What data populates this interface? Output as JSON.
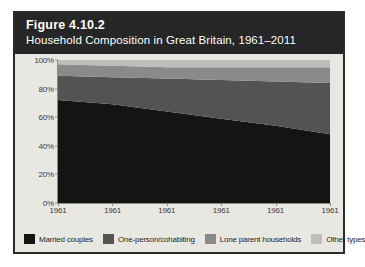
{
  "figure": {
    "number": "Figure 4.10.2",
    "title": "Household Composition in Great Britain, 1961–2011"
  },
  "colors": {
    "header_background": "#262626",
    "card_background": "#e9e7e2",
    "plot_background": "#f3f1ed",
    "border": "#2b2b2b",
    "axis": "#8d8a85",
    "married_couples": "#141414",
    "one_person_cohabiting": "#535353",
    "lone_parent_households": "#8a8a8a",
    "other_types": "#bdbdbd"
  },
  "legend": {
    "items": [
      {
        "label": "Married couples",
        "color": "#141414"
      },
      {
        "label": "One-person/cohabiting",
        "color": "#535353"
      },
      {
        "label": "Lone parent households",
        "color": "#8a8a8a"
      },
      {
        "label": "Other types",
        "color": "#bdbdbd"
      }
    ]
  },
  "chart_data": {
    "type": "area",
    "stacked": true,
    "normalized": true,
    "title": "Household Composition in Great Britain, 1961–2011",
    "xlabel": "",
    "ylabel": "",
    "ylim": [
      0,
      100
    ],
    "ytick_labels": [
      "0%",
      "20%",
      "40%",
      "60%",
      "80%",
      "100%"
    ],
    "ytick_values": [
      0,
      20,
      40,
      60,
      80,
      100
    ],
    "grid": false,
    "legend_position": "bottom",
    "x": [
      0,
      1,
      2,
      3,
      4,
      5
    ],
    "xtick_labels": [
      "1961",
      "1961",
      "1961",
      "1961",
      "1961",
      "1961"
    ],
    "series": [
      {
        "name": "Married couples",
        "color": "#141414",
        "values": [
          72,
          69,
          64,
          59,
          54,
          48
        ]
      },
      {
        "name": "One-person/cohabiting",
        "color": "#535353",
        "values": [
          17,
          19,
          23,
          27,
          31,
          36
        ]
      },
      {
        "name": "Lone parent households",
        "color": "#8a8a8a",
        "values": [
          8,
          8,
          8,
          9,
          10,
          11
        ]
      },
      {
        "name": "Other types",
        "color": "#bdbdbd",
        "values": [
          3,
          4,
          5,
          5,
          5,
          5
        ]
      }
    ]
  }
}
